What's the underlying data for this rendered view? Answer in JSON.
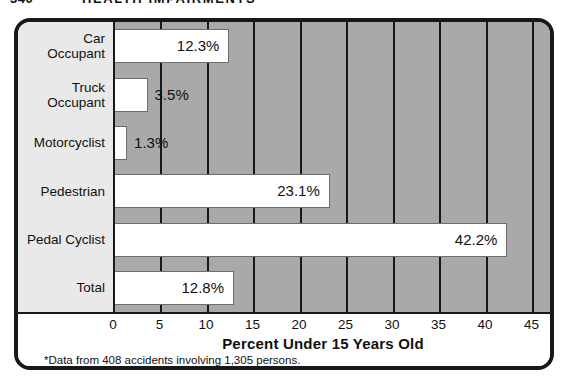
{
  "header": {
    "folio": "340",
    "running_title": "HEALTH IMPAIRMENTS"
  },
  "figure": {
    "axis_title": "Percent Under 15 Years Old",
    "footnote": "*Data from 408 accidents involving 1,305 persons."
  },
  "chart_data": {
    "type": "bar",
    "orientation": "horizontal",
    "title": "",
    "xlabel": "Percent Under 15 Years Old",
    "ylabel": "",
    "xlim": [
      0,
      47
    ],
    "xticks": [
      0,
      5,
      10,
      15,
      20,
      25,
      30,
      35,
      40,
      45
    ],
    "xtick_labels": [
      "0",
      "5",
      "10",
      "15",
      "20",
      "25",
      "30",
      "35",
      "40",
      "45"
    ],
    "grid": true,
    "grid_axis": "x",
    "legend": false,
    "categories": [
      "Car\nOccupant",
      "Truck\nOccupant",
      "Motorcyclist",
      "Pedestrian",
      "Pedal Cyclist",
      "Total"
    ],
    "category_labels": [
      [
        "Car",
        "Occupant"
      ],
      [
        "Truck",
        "Occupant"
      ],
      [
        "Motorcyclist"
      ],
      [
        "Pedestrian"
      ],
      [
        "Pedal Cyclist"
      ],
      [
        "Total"
      ]
    ],
    "values": [
      12.3,
      3.5,
      1.3,
      23.1,
      42.2,
      12.8
    ],
    "data_labels": [
      "12.3%",
      "3.5%",
      "1.3%",
      "23.1%",
      "42.2%",
      "12.8%"
    ],
    "label_position": [
      "inside",
      "outside",
      "outside",
      "inside",
      "inside",
      "inside"
    ],
    "bar_color": "#ffffff",
    "plot_background": "#a9a9a9",
    "label_gutter_background": "#e9e9e9",
    "frame_color": "#17181a",
    "footnote": "*Data from 408 accidents involving 1,305 persons."
  }
}
